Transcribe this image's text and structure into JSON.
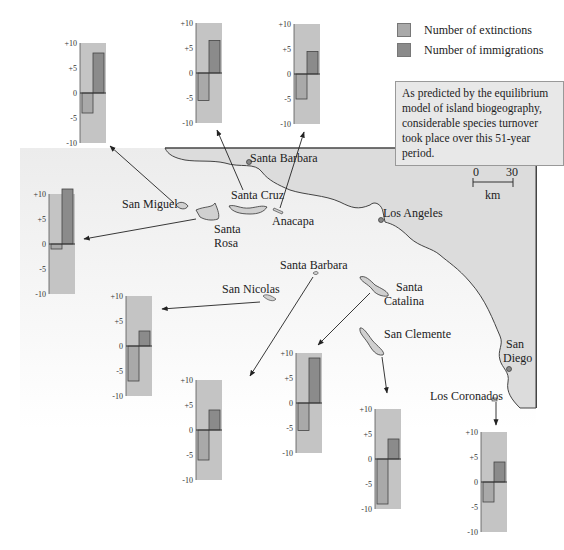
{
  "legend": {
    "extinctions_label": "Number of extinctions",
    "immigrations_label": "Number of immigrations",
    "extinctions_color": "#a9a9a9",
    "immigrations_color": "#8b8b8b"
  },
  "callout": {
    "text": "As predicted by the equilibrium model of island biogeography, considerable species turnover took place over this 51-year period."
  },
  "scale_bar": {
    "min_label": "0",
    "max_label": "30",
    "unit": "km"
  },
  "map_labels": {
    "santa_barbara_city": "Santa Barbara",
    "los_angeles": "Los Angeles",
    "san_diego_line1": "San",
    "san_diego_line2": "Diego",
    "san_miguel": "San Miguel",
    "santa_cruz": "Santa Cruz",
    "anacapa": "Anacapa",
    "santa_rosa_line1": "Santa",
    "santa_rosa_line2": "Rosa",
    "santa_barbara_island": "Santa Barbara",
    "san_nicolas": "San Nicolas",
    "santa_catalina_line1": "Santa",
    "santa_catalina_line2": "Catalina",
    "san_clemente": "San Clemente",
    "los_coronados": "Los Coronados"
  },
  "axis_ticks": [
    "+10",
    "+5",
    "0",
    "-5",
    "-10"
  ],
  "chart_data": {
    "type": "bar",
    "ylim": [
      -10,
      10
    ],
    "yticks": [
      "+10",
      "+5",
      "0",
      "-5",
      "-10"
    ],
    "legend": [
      "Number of extinctions",
      "Number of immigrations"
    ],
    "categories": [
      "San Miguel",
      "Santa Cruz",
      "Anacapa",
      "Santa Rosa",
      "San Nicolas",
      "Santa Barbara",
      "Santa Catalina",
      "San Clemente",
      "Los Coronados"
    ],
    "series": [
      {
        "name": "Number of extinctions",
        "values": [
          -4,
          -5.5,
          -5,
          -1,
          -7,
          -6,
          -5.5,
          -9,
          -4
        ]
      },
      {
        "name": "Number of immigrations",
        "values": [
          8,
          6.5,
          4.5,
          11,
          3,
          4,
          9,
          4,
          4
        ]
      }
    ]
  }
}
